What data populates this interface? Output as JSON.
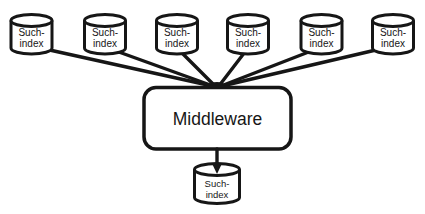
{
  "diagram": {
    "colors": {
      "background": "#ffffff",
      "stroke": "#161616",
      "text": "#161616"
    },
    "top_databases": [
      {
        "line1": "Such-",
        "line2": "index"
      },
      {
        "line1": "Such-",
        "line2": "index"
      },
      {
        "line1": "Such-",
        "line2": "index"
      },
      {
        "line1": "Such-",
        "line2": "index"
      },
      {
        "line1": "Such-",
        "line2": "index"
      },
      {
        "line1": "Such-",
        "line2": "index"
      }
    ],
    "middleware": {
      "label": "Middleware"
    },
    "bottom_database": {
      "line1": "Such-",
      "line2": "index"
    }
  }
}
